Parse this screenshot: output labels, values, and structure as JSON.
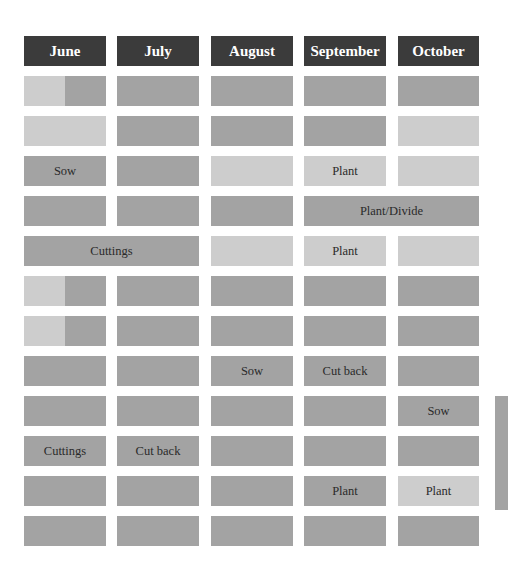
{
  "colors": {
    "header": "#3b3b3b",
    "dark": "#a3a3a3",
    "light": "#cdcdcd",
    "background": "#ffffff"
  },
  "header": {
    "months": [
      "June",
      "July",
      "August",
      "September",
      "October"
    ]
  },
  "rows": [
    {
      "cells": [
        {
          "span": 1,
          "shade": "split",
          "label": ""
        },
        {
          "span": 1,
          "shade": "dark",
          "label": ""
        },
        {
          "span": 1,
          "shade": "dark",
          "label": ""
        },
        {
          "span": 1,
          "shade": "dark",
          "label": ""
        },
        {
          "span": 1,
          "shade": "dark",
          "label": ""
        }
      ]
    },
    {
      "cells": [
        {
          "span": 1,
          "shade": "light",
          "label": ""
        },
        {
          "span": 1,
          "shade": "dark",
          "label": ""
        },
        {
          "span": 1,
          "shade": "dark",
          "label": ""
        },
        {
          "span": 1,
          "shade": "dark",
          "label": ""
        },
        {
          "span": 1,
          "shade": "light",
          "label": ""
        }
      ]
    },
    {
      "cells": [
        {
          "span": 1,
          "shade": "dark",
          "label": "Sow"
        },
        {
          "span": 1,
          "shade": "dark",
          "label": ""
        },
        {
          "span": 1,
          "shade": "light",
          "label": ""
        },
        {
          "span": 1,
          "shade": "light",
          "label": "Plant"
        },
        {
          "span": 1,
          "shade": "light",
          "label": ""
        }
      ]
    },
    {
      "cells": [
        {
          "span": 1,
          "shade": "dark",
          "label": ""
        },
        {
          "span": 1,
          "shade": "dark",
          "label": ""
        },
        {
          "span": 1,
          "shade": "dark",
          "label": ""
        },
        {
          "span": 2,
          "shade": "dark",
          "label": "Plant/Divide"
        }
      ]
    },
    {
      "cells": [
        {
          "span": 2,
          "shade": "dark",
          "label": "Cuttings"
        },
        {
          "span": 1,
          "shade": "light",
          "label": ""
        },
        {
          "span": 1,
          "shade": "light",
          "label": "Plant"
        },
        {
          "span": 1,
          "shade": "light",
          "label": ""
        }
      ]
    },
    {
      "cells": [
        {
          "span": 1,
          "shade": "split",
          "label": ""
        },
        {
          "span": 1,
          "shade": "dark",
          "label": ""
        },
        {
          "span": 1,
          "shade": "dark",
          "label": ""
        },
        {
          "span": 1,
          "shade": "dark",
          "label": ""
        },
        {
          "span": 1,
          "shade": "dark",
          "label": ""
        }
      ]
    },
    {
      "cells": [
        {
          "span": 1,
          "shade": "split",
          "label": ""
        },
        {
          "span": 1,
          "shade": "dark",
          "label": ""
        },
        {
          "span": 1,
          "shade": "dark",
          "label": ""
        },
        {
          "span": 1,
          "shade": "dark",
          "label": ""
        },
        {
          "span": 1,
          "shade": "dark",
          "label": ""
        }
      ]
    },
    {
      "cells": [
        {
          "span": 1,
          "shade": "dark",
          "label": ""
        },
        {
          "span": 1,
          "shade": "dark",
          "label": ""
        },
        {
          "span": 1,
          "shade": "dark",
          "label": "Sow"
        },
        {
          "span": 1,
          "shade": "dark",
          "label": "Cut back"
        },
        {
          "span": 1,
          "shade": "dark",
          "label": ""
        }
      ]
    },
    {
      "cells": [
        {
          "span": 1,
          "shade": "dark",
          "label": ""
        },
        {
          "span": 1,
          "shade": "dark",
          "label": ""
        },
        {
          "span": 1,
          "shade": "dark",
          "label": ""
        },
        {
          "span": 1,
          "shade": "dark",
          "label": ""
        },
        {
          "span": 1,
          "shade": "dark",
          "label": "Sow"
        }
      ]
    },
    {
      "cells": [
        {
          "span": 1,
          "shade": "dark",
          "label": "Cuttings"
        },
        {
          "span": 1,
          "shade": "dark",
          "label": "Cut back"
        },
        {
          "span": 1,
          "shade": "dark",
          "label": ""
        },
        {
          "span": 1,
          "shade": "dark",
          "label": ""
        },
        {
          "span": 1,
          "shade": "dark",
          "label": ""
        }
      ]
    },
    {
      "cells": [
        {
          "span": 1,
          "shade": "dark",
          "label": ""
        },
        {
          "span": 1,
          "shade": "dark",
          "label": ""
        },
        {
          "span": 1,
          "shade": "dark",
          "label": ""
        },
        {
          "span": 1,
          "shade": "dark",
          "label": "Plant"
        },
        {
          "span": 1,
          "shade": "light",
          "label": "Plant"
        }
      ]
    },
    {
      "cells": [
        {
          "span": 1,
          "shade": "dark",
          "label": ""
        },
        {
          "span": 1,
          "shade": "dark",
          "label": ""
        },
        {
          "span": 1,
          "shade": "dark",
          "label": ""
        },
        {
          "span": 1,
          "shade": "dark",
          "label": ""
        },
        {
          "span": 1,
          "shade": "dark",
          "label": ""
        }
      ]
    }
  ],
  "chart_data": {
    "type": "table",
    "title": "",
    "columns": [
      "June",
      "July",
      "August",
      "September",
      "October"
    ],
    "rows": [
      [
        "",
        "",
        "",
        "",
        ""
      ],
      [
        "",
        "",
        "",
        "",
        ""
      ],
      [
        "Sow",
        "",
        "",
        "Plant",
        ""
      ],
      [
        "",
        "",
        "",
        "Plant/Divide",
        "Plant/Divide"
      ],
      [
        "Cuttings",
        "Cuttings",
        "",
        "Plant",
        ""
      ],
      [
        "",
        "",
        "",
        "",
        ""
      ],
      [
        "",
        "",
        "",
        "",
        ""
      ],
      [
        "",
        "",
        "Sow",
        "Cut back",
        ""
      ],
      [
        "",
        "",
        "",
        "",
        "Sow"
      ],
      [
        "Cuttings",
        "Cut back",
        "",
        "",
        ""
      ],
      [
        "",
        "",
        "",
        "Plant",
        "Plant"
      ],
      [
        "",
        "",
        "",
        "",
        ""
      ]
    ],
    "shading": [
      [
        "light|dark",
        "dark",
        "dark",
        "dark",
        "dark"
      ],
      [
        "light",
        "dark",
        "dark",
        "dark",
        "light"
      ],
      [
        "dark",
        "dark",
        "light",
        "light",
        "light"
      ],
      [
        "dark",
        "dark",
        "dark",
        "dark",
        "dark"
      ],
      [
        "dark",
        "dark",
        "light",
        "light",
        "light"
      ],
      [
        "light|dark",
        "dark",
        "dark",
        "dark",
        "dark"
      ],
      [
        "light|dark",
        "dark",
        "dark",
        "dark",
        "dark"
      ],
      [
        "dark",
        "dark",
        "dark",
        "dark",
        "dark"
      ],
      [
        "dark",
        "dark",
        "dark",
        "dark",
        "dark"
      ],
      [
        "dark",
        "dark",
        "dark",
        "dark",
        "dark"
      ],
      [
        "dark",
        "dark",
        "dark",
        "dark",
        "light"
      ],
      [
        "dark",
        "dark",
        "dark",
        "dark",
        "dark"
      ]
    ]
  }
}
